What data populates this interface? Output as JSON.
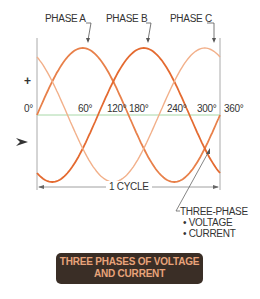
{
  "phase_labels": [
    "PHASE A",
    "PHASE B",
    "PHASE C"
  ],
  "axis": {
    "plus": "+",
    "minus": "–",
    "ticks": [
      "0°",
      "60°",
      "120°",
      "180°",
      "240°",
      "300°",
      "360°"
    ]
  },
  "cycle_label": "1 CYCLE",
  "note": {
    "title": "THREE-PHASE",
    "items": [
      "• VOLTAGE",
      "• CURRENT"
    ]
  },
  "caption": {
    "line1": "THREE PHASES OF VOLTAGE",
    "line2": "AND CURRENT"
  },
  "colors": {
    "phase_a": "#e8804a",
    "phase_b": "#e46a30",
    "phase_c": "#f2b08a",
    "zero_line": "#a8d8a8",
    "axis": "#999999",
    "caption_bg": "#3a2e26",
    "caption_text": "#e8a37a"
  },
  "chart_data": {
    "type": "line",
    "title": "THREE PHASES OF VOLTAGE AND CURRENT",
    "xlabel": "degrees (1 CYCLE)",
    "ylabel": "+ / -",
    "x": [
      0,
      60,
      120,
      180,
      240,
      300,
      360
    ],
    "series": [
      {
        "name": "PHASE A",
        "values": [
          0,
          0.866,
          0.866,
          0,
          -0.866,
          -0.866,
          0
        ],
        "phase_deg": 0
      },
      {
        "name": "PHASE B",
        "values": [
          -0.866,
          0,
          0.866,
          0.866,
          0,
          -0.866,
          -0.866
        ],
        "phase_deg": 120
      },
      {
        "name": "PHASE C",
        "values": [
          0.866,
          0.866,
          0,
          -0.866,
          -0.866,
          0,
          0.866
        ],
        "phase_deg": 240
      }
    ],
    "xlim": [
      0,
      360
    ],
    "ylim": [
      -1,
      1
    ],
    "grid": false
  }
}
